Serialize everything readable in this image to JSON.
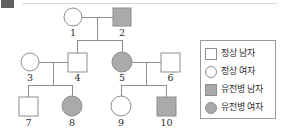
{
  "diagram": {
    "colors": {
      "stroke": "#8d8d8d",
      "affected_fill": "#aaaaaa",
      "unaffected_fill": "#ffffff",
      "label_text": "#2a2a2a"
    },
    "generations": [
      {
        "name": "I",
        "members": [
          {
            "id": "1",
            "label": "1",
            "sex": "female",
            "shape": "circle",
            "affected": false,
            "cx": 73,
            "cy": 17,
            "r": 9
          },
          {
            "id": "2",
            "label": "2",
            "sex": "male",
            "shape": "square",
            "affected": true,
            "cx": 122,
            "cy": 17,
            "r": 9
          }
        ]
      },
      {
        "name": "II",
        "members": [
          {
            "id": "3",
            "label": "3",
            "sex": "female",
            "shape": "circle",
            "affected": false,
            "cx": 30,
            "cy": 62,
            "r": 9
          },
          {
            "id": "4",
            "label": "4",
            "sex": "male",
            "shape": "square",
            "affected": false,
            "cx": 77,
            "cy": 62,
            "r": 9
          },
          {
            "id": "5",
            "label": "5",
            "sex": "female",
            "shape": "circle",
            "affected": true,
            "cx": 122,
            "cy": 62,
            "r": 10
          },
          {
            "id": "6",
            "label": "6",
            "sex": "male",
            "shape": "square",
            "affected": false,
            "cx": 170,
            "cy": 62,
            "r": 9
          }
        ]
      },
      {
        "name": "III",
        "members": [
          {
            "id": "7",
            "label": "7",
            "sex": "male",
            "shape": "square",
            "affected": false,
            "cx": 28,
            "cy": 106,
            "r": 9
          },
          {
            "id": "8",
            "label": "8",
            "sex": "female",
            "shape": "circle",
            "affected": true,
            "cx": 72,
            "cy": 106,
            "r": 10
          },
          {
            "id": "9",
            "label": "9",
            "sex": "female",
            "shape": "circle",
            "affected": false,
            "cx": 121,
            "cy": 106,
            "r": 10
          },
          {
            "id": "10",
            "label": "10",
            "sex": "male",
            "shape": "square",
            "affected": true,
            "cx": 166,
            "cy": 106,
            "r": 9
          }
        ]
      }
    ],
    "matings": [
      {
        "id": "m1",
        "partners": [
          "1",
          "2"
        ],
        "children": [
          "4",
          "5"
        ]
      },
      {
        "id": "m2",
        "partners": [
          "3",
          "4"
        ],
        "children": [
          "7",
          "8"
        ]
      },
      {
        "id": "m3",
        "partners": [
          "5",
          "6"
        ],
        "children": [
          "9",
          "10"
        ]
      }
    ]
  },
  "legend": {
    "items": [
      {
        "key": "normal-male",
        "shape": "square",
        "filled": false,
        "label": "정상 남자"
      },
      {
        "key": "normal-female",
        "shape": "circle",
        "filled": false,
        "label": "정상 여자"
      },
      {
        "key": "affected-male",
        "shape": "square",
        "filled": true,
        "label": "유전병 남자"
      },
      {
        "key": "affected-female",
        "shape": "circle",
        "filled": true,
        "label": "유전병 여자"
      }
    ]
  }
}
